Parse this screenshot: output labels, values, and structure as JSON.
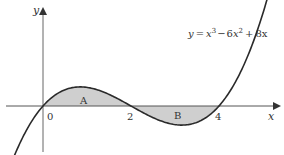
{
  "equation": {
    "lhs": "y",
    "eq": "=",
    "term1_base": "x",
    "term1_exp": "3",
    "op1": "−",
    "term2_coef": "6",
    "term2_base": "x",
    "term2_exp": "2",
    "op2": "+",
    "term3": "8x"
  },
  "axes": {
    "x_label": "x",
    "y_label": "y",
    "origin_label": "0",
    "tick_labels": [
      "2",
      "4"
    ]
  },
  "regions": [
    {
      "label": "A",
      "from": 0,
      "to": 2
    },
    {
      "label": "B",
      "from": 2,
      "to": 4
    }
  ],
  "colors": {
    "curve": "#2a2a2a",
    "axis": "#555555",
    "shade": "#cfcfcf",
    "text": "#333333"
  },
  "chart_data": {
    "type": "line",
    "function": "x^3 - 6x^2 + 8x",
    "xlabel": "x",
    "ylabel": "y",
    "x_ticks": [
      0,
      2,
      4
    ],
    "roots": [
      0,
      2,
      4
    ],
    "shaded_regions": [
      {
        "label": "A",
        "x_range": [
          0,
          2
        ],
        "side": "above x-axis"
      },
      {
        "label": "B",
        "x_range": [
          2,
          4
        ],
        "side": "below x-axis"
      }
    ],
    "xlim": [
      -0.7,
      5.1
    ],
    "grid": false
  }
}
